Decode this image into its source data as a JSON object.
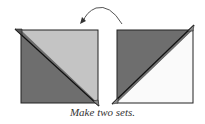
{
  "caption": "Make two sets.",
  "colors": {
    "dark_triangle": "#6e6e6e",
    "light_triangle": "#c4c4c4",
    "white_triangle": "#fafafa",
    "outline": "#222222",
    "arrow": "#555555"
  },
  "diagram": {
    "left_square": {
      "upper_right_half": "light gray",
      "lower_left_half": "dark gray",
      "diagonal": "top-left to bottom-right"
    },
    "right_square": {
      "upper_left_half": "dark gray",
      "lower_right_half": "white",
      "diagonal": "bottom-left to top-right"
    },
    "arrow": "curved arrow from right square to left square (flip)"
  }
}
